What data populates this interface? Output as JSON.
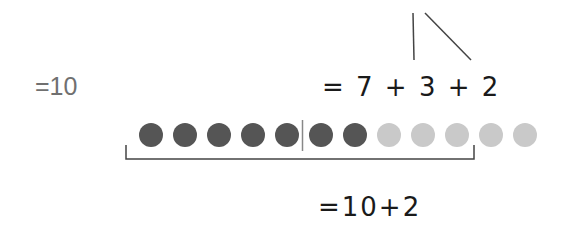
{
  "equations": {
    "left": "=10",
    "top": "= 7 + 3 + 2",
    "bottom": "=10+2"
  },
  "dots": {
    "total": 12,
    "dark_count": 7,
    "light_count": 5,
    "colors": {
      "dark": "#555555",
      "light": "#c9c9c9"
    },
    "divider_after_index": 5
  },
  "bracket": {
    "spans_dots": 10
  }
}
